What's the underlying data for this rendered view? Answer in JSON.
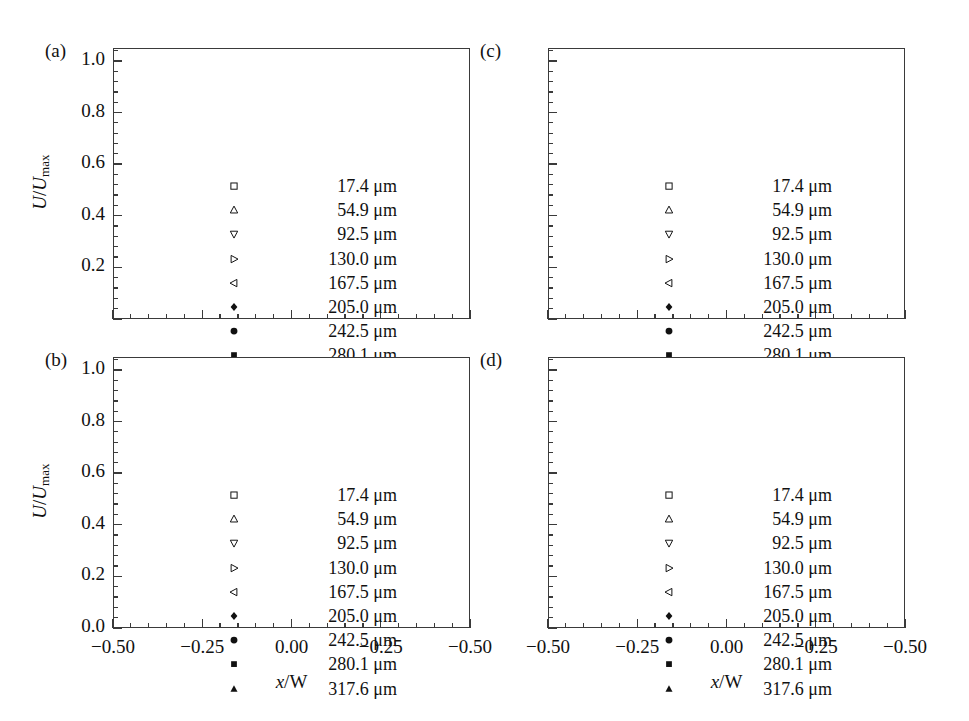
{
  "figure": {
    "background": "#ffffff",
    "ink": "#1a1a1a",
    "frame_color": "#3a3a3a"
  },
  "axis": {
    "ytitle_num": "U",
    "ytitle_den": "U",
    "ytitle_sub": "max",
    "ytitle_slash": "/",
    "xtitle_var": "x",
    "xtitle_rest": "/W",
    "y_ticklabels_full": [
      "0.0",
      "0.2",
      "0.4",
      "0.6",
      "0.8",
      "1.0"
    ],
    "y_ticklabels_partial": [
      "0.2",
      "0.4",
      "0.6",
      "0.8",
      "1.0"
    ],
    "x_ticklabels": [
      "−0.50",
      "−0.25",
      "0.00",
      "−0.25",
      "−0.50"
    ],
    "x_tickvalues": [
      -0.5,
      -0.25,
      0.0,
      0.25,
      0.5
    ],
    "y_tickvalues": [
      0.0,
      0.2,
      0.4,
      0.6,
      0.8,
      1.0
    ],
    "xlim": [
      -0.5,
      0.5
    ],
    "ylim": [
      0.0,
      1.05
    ],
    "minor_ticks_per_interval": 4,
    "grid": false
  },
  "legend": {
    "position": "inside-center",
    "unit": "μm",
    "entries": [
      {
        "label": "17.4 μm",
        "value": 17.4,
        "marker": "open-square"
      },
      {
        "label": "54.9 μm",
        "value": 54.9,
        "marker": "open-triangle-up"
      },
      {
        "label": "92.5 μm",
        "value": 92.5,
        "marker": "open-triangle-down"
      },
      {
        "label": "130.0 μm",
        "value": 130.0,
        "marker": "open-triangle-right"
      },
      {
        "label": "167.5 μm",
        "value": 167.5,
        "marker": "open-triangle-left"
      },
      {
        "label": "205.0 μm",
        "value": 205.0,
        "marker": "filled-diamond"
      },
      {
        "label": "242.5 μm",
        "value": 242.5,
        "marker": "filled-circle"
      },
      {
        "label": "280.1 μm",
        "value": 280.1,
        "marker": "filled-square"
      },
      {
        "label": "317.6 μm",
        "value": 317.6,
        "marker": "filled-triangle-up"
      }
    ]
  },
  "panels": [
    {
      "tag": "(a)",
      "col": 0,
      "row": 0,
      "show_ylabels": true,
      "ylabels": [
        "0.2",
        "0.4",
        "0.6",
        "0.8",
        "1.0"
      ],
      "show_xlabels": false,
      "show_ytitle": true,
      "show_xtitle": false,
      "profile": {
        "bluntness_min": 1.85,
        "bluntness_max": 2.55,
        "peak_min": 0.865,
        "peak_max": 1.0,
        "half_width": 0.47,
        "noise": 0.013,
        "seed": 11
      }
    },
    {
      "tag": "(b)",
      "col": 0,
      "row": 1,
      "show_ylabels": true,
      "ylabels": [
        "0.0",
        "0.2",
        "0.4",
        "0.6",
        "0.8",
        "1.0"
      ],
      "show_xlabels": true,
      "show_ytitle": true,
      "show_xtitle": true,
      "profile": {
        "bluntness_min": 2.35,
        "bluntness_max": 3.3,
        "peak_min": 0.82,
        "peak_max": 1.0,
        "half_width": 0.47,
        "noise": 0.014,
        "seed": 29
      }
    },
    {
      "tag": "(c)",
      "col": 1,
      "row": 0,
      "show_ylabels": false,
      "ylabels": [],
      "show_xlabels": false,
      "show_ytitle": false,
      "show_xtitle": false,
      "profile": {
        "bluntness_min": 2.6,
        "bluntness_max": 3.7,
        "peak_min": 0.8,
        "peak_max": 1.0,
        "half_width": 0.47,
        "noise": 0.016,
        "seed": 47
      }
    },
    {
      "tag": "(d)",
      "col": 1,
      "row": 1,
      "show_ylabels": false,
      "ylabels": [],
      "show_xlabels": true,
      "show_ytitle": false,
      "show_xtitle": true,
      "profile": {
        "bluntness_min": 2.9,
        "bluntness_max": 4.3,
        "peak_min": 0.78,
        "peak_max": 1.0,
        "half_width": 0.47,
        "noise": 0.015,
        "seed": 73
      }
    }
  ],
  "chart_data": {
    "type": "scatter",
    "title": "",
    "xlabel": "x/W",
    "ylabel": "U/Umax",
    "xlim": [
      -0.5,
      0.5
    ],
    "ylim": [
      0.0,
      1.05
    ],
    "grid": false,
    "legend_position": "inside-center",
    "panel_count": 4,
    "panel_tags": [
      "(a)",
      "(b)",
      "(c)",
      "(d)"
    ],
    "series_names": [
      "17.4 μm",
      "54.9 μm",
      "92.5 μm",
      "130.0 μm",
      "167.5 μm",
      "205.0 μm",
      "242.5 μm",
      "280.1 μm",
      "317.6 μm"
    ],
    "series_depth_um": [
      17.4,
      54.9,
      92.5,
      130.0,
      167.5,
      205.0,
      242.5,
      280.1,
      317.6
    ],
    "panel_centerline_values": {
      "(a)": [
        0.87,
        0.93,
        0.955,
        0.965,
        0.97,
        0.985,
        0.99,
        0.98,
        0.975
      ],
      "(b)": [
        0.815,
        0.885,
        0.935,
        0.955,
        0.965,
        0.985,
        0.995,
        0.985,
        0.99
      ],
      "(c)": [
        0.79,
        0.855,
        0.905,
        0.94,
        0.955,
        0.985,
        0.995,
        0.985,
        0.99
      ],
      "(d)": [
        0.765,
        0.835,
        0.89,
        0.925,
        0.95,
        0.98,
        0.995,
        0.985,
        0.985
      ]
    },
    "x_sample_range": [
      -0.455,
      0.455
    ],
    "points_per_series": 42
  }
}
